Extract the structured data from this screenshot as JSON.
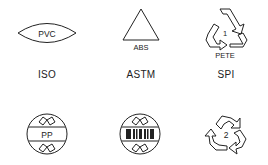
{
  "figure": {
    "row1": [
      {
        "standard": "ISO",
        "symbol_text": "PVC",
        "shape": "lens"
      },
      {
        "standard": "ASTM",
        "symbol_text": "ABS",
        "shape": "triangle"
      },
      {
        "standard": "SPI",
        "symbol_number": "1",
        "symbol_text": "PETE",
        "shape": "recycling-triangle"
      }
    ],
    "row2": [
      {
        "symbol_text": "PP",
        "shape": "circle-banded"
      },
      {
        "symbol_text": "",
        "shape": "circle-barcode"
      },
      {
        "symbol_number": "2",
        "shape": "recycling-arrows"
      }
    ],
    "colors": {
      "stroke": "#222222",
      "background": "#ffffff"
    }
  }
}
